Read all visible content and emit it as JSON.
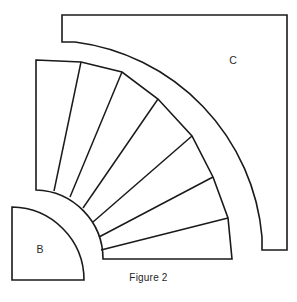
{
  "figure": {
    "caption": "Figure 2",
    "caption_position": {
      "x": 155,
      "y": 272
    },
    "background_color": "#ffffff",
    "stroke_color": "#1a1a1a",
    "fill_color": "#ffffff",
    "canvas": {
      "width": 297,
      "height": 302
    },
    "labels": [
      {
        "name": "region-c",
        "text": "C",
        "x": 233,
        "y": 61
      },
      {
        "name": "region-b",
        "text": "B",
        "x": 40,
        "y": 250
      }
    ],
    "regions": {
      "c": {
        "label": "C",
        "description": "square plate with quarter-annulus notch removed at lower left",
        "outer_square": {
          "left": 62,
          "top": 15,
          "right": 287,
          "bottom": 250
        },
        "notch_top_y": 42,
        "notch_right_x": 262,
        "arc_center": {
          "x": 103,
          "y": 259
        },
        "arc_radius": 215,
        "path": "M 62 15 L 287 15 L 287 250 L 262 250 L 262 237 A 215 215 0 0 0 75 42 L 62 42 Z"
      },
      "b": {
        "label": "B",
        "description": "quarter disk with vertical left edge, horizontal bottom edge and convex arc",
        "corner": {
          "x": 12,
          "y": 280
        },
        "top_left": {
          "x": 12,
          "y": 207
        },
        "bottom_right": {
          "x": 84,
          "y": 280
        },
        "arc_radius": 73,
        "path": "M 12 207 A 73 73 0 0 1 84 280 L 12 280 Z"
      },
      "fan": {
        "description": "seven tapered step segments radiating from a common centre, bounded by an inner arc and a chorded outer boundary",
        "center": {
          "x": 103,
          "y": 259
        },
        "inner_radius": 69,
        "outer_radius": 176,
        "segment_count": 7,
        "start_angle_deg": 180,
        "end_angle_deg": 90,
        "outer_vertices": [
          {
            "x": 36,
            "y": 60
          },
          {
            "x": 81,
            "y": 62
          },
          {
            "x": 122,
            "y": 72
          },
          {
            "x": 158,
            "y": 99
          },
          {
            "x": 192,
            "y": 136
          },
          {
            "x": 213,
            "y": 177
          },
          {
            "x": 228,
            "y": 218
          },
          {
            "x": 232,
            "y": 259
          }
        ],
        "inner_vertices": [
          {
            "x": 36,
            "y": 190
          },
          {
            "x": 54,
            "y": 191
          },
          {
            "x": 70,
            "y": 197
          },
          {
            "x": 83,
            "y": 208
          },
          {
            "x": 93,
            "y": 222
          },
          {
            "x": 99,
            "y": 237
          },
          {
            "x": 101,
            "y": 250
          },
          {
            "x": 103,
            "y": 259
          }
        ],
        "left_edge": {
          "x": 36,
          "y_top": 60,
          "y_bottom": 190
        },
        "bottom_edge": {
          "y": 259,
          "x_left": 103,
          "x_right": 232
        },
        "outline_path": "M 36 60 L 81 62 L 122 72 L 158 99 L 192 136 L 213 177 L 228 218 L 232 259 L 103 259 A 69 69 0 0 0 36 190 Z",
        "dividers": [
          "M 81 62 L 54 191",
          "M 122 72 L 70 197",
          "M 158 99 L 83 208",
          "M 192 136 L 93 222",
          "M 213 177 L 99 237",
          "M 228 218 L 101 250"
        ]
      }
    }
  }
}
